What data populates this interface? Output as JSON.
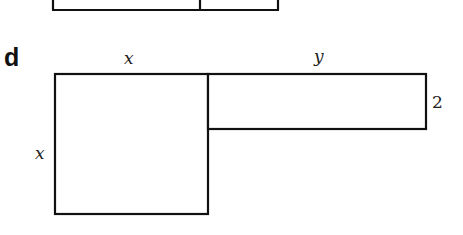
{
  "figure": {
    "part_label": "d",
    "previous_part": {
      "description": "bottom edge of previous figure (partially cropped)"
    },
    "square": {
      "top_label": "x",
      "side_label": "x"
    },
    "rectangle": {
      "top_label": "y",
      "side_label": "2"
    },
    "colors": {
      "stroke": "#111111",
      "text": "#222222",
      "background": "#ffffff"
    }
  }
}
